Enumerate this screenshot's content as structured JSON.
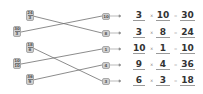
{
  "left_cards": [
    {
      "numerator": "24",
      "denominator": "3"
    },
    {
      "numerator": "30",
      "denominator": "3"
    },
    {
      "numerator": "18",
      "denominator": "6"
    },
    {
      "numerator": "10",
      "denominator": "10"
    },
    {
      "numerator": "36",
      "denominator": "9"
    }
  ],
  "right_boxes": [
    "10",
    "8",
    "1",
    "4",
    "3"
  ],
  "connections": [
    {
      "from": "24/3",
      "to": "8"
    },
    {
      "from": "30/3",
      "to": "10"
    },
    {
      "from": "18/6",
      "to": "3"
    },
    {
      "from": "10/10",
      "to": "1"
    },
    {
      "from": "36/9",
      "to": "4"
    }
  ],
  "equations": [
    {
      "a": "3",
      "op1": "×",
      "b": "10",
      "op2": "=",
      "c": "30"
    },
    {
      "a": "3",
      "op1": "×",
      "b": "8",
      "op2": "=",
      "c": "24"
    },
    {
      "a": "10",
      "op1": "×",
      "b": "1",
      "op2": "=",
      "c": "10"
    },
    {
      "a": "9",
      "op1": "×",
      "b": "4",
      "op2": "=",
      "c": "36"
    },
    {
      "a": "6",
      "op1": "×",
      "b": "3",
      "op2": "=",
      "c": "18"
    }
  ],
  "colors": {
    "card_fill": "#cfcfcf",
    "line": "#6e6e6e",
    "text": "#333333"
  }
}
